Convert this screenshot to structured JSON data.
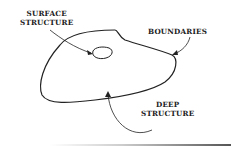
{
  "diagram": {
    "labels": {
      "surface_line1": "SURFACE",
      "surface_line2": "STRUCTURE",
      "boundaries": "BOUNDARIES",
      "deep_line1": "DEEP",
      "deep_line2": "STRUCTURE"
    },
    "colors": {
      "stroke": "#222222",
      "background": "#ffffff"
    }
  }
}
